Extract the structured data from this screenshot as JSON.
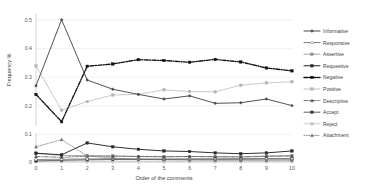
{
  "chart_data": {
    "type": "line",
    "title": "",
    "xlabel": "Order of the comments",
    "ylabel": "Frequency %",
    "x": [
      0,
      1,
      2,
      3,
      4,
      5,
      6,
      7,
      8,
      9,
      10
    ],
    "xlim": [
      0,
      10
    ],
    "ylim": [
      0,
      0.5
    ],
    "grid": true,
    "legend_position": "right",
    "xticks": [
      "0",
      "1",
      "2",
      "3",
      "4",
      "5",
      "6",
      "7",
      "8",
      "9",
      "10"
    ],
    "yticks_upper": [
      "0.2",
      "0.3",
      "0.4",
      "0.5"
    ],
    "yticks_lower": [
      "0",
      "0.1"
    ],
    "axis_break": true,
    "panels": [
      {
        "name": "upper",
        "ymin": 0.13,
        "ymax": 0.52,
        "series": [
          "Informative",
          "Negative",
          "Positive"
        ]
      },
      {
        "name": "lower",
        "ymin": 0.0,
        "ymax": 0.105,
        "series": [
          "Responsive",
          "Assertive",
          "Requestive",
          "Descriptive",
          "Accept",
          "Reject",
          "Attachment"
        ]
      }
    ],
    "series": [
      {
        "name": "Informative",
        "color": "#4a4a4a",
        "dash": "none",
        "marker": "diamond",
        "panel": "upper",
        "values": [
          0.27,
          0.5,
          0.29,
          0.258,
          0.24,
          0.224,
          0.235,
          0.209,
          0.211,
          0.224,
          0.201
        ]
      },
      {
        "name": "Responsive",
        "color": "#595959",
        "dash": "none",
        "marker": "circle-open",
        "panel": "lower",
        "values": [
          0.009,
          0.01,
          0.011,
          0.012,
          0.011,
          0.011,
          0.011,
          0.011,
          0.012,
          0.012,
          0.012
        ]
      },
      {
        "name": "Assertive",
        "color": "#8c8c8c",
        "dash": "none",
        "marker": "square",
        "panel": "lower",
        "values": [
          0.031,
          0.024,
          0.023,
          0.022,
          0.02,
          0.019,
          0.02,
          0.019,
          0.019,
          0.022,
          0.024
        ]
      },
      {
        "name": "Requestive",
        "color": "#262626",
        "dash": "none",
        "marker": "square",
        "panel": "lower",
        "values": [
          0.032,
          0.026,
          0.069,
          0.055,
          0.046,
          0.04,
          0.038,
          0.033,
          0.03,
          0.033,
          0.04
        ]
      },
      {
        "name": "Negative",
        "color": "#111111",
        "dash": "dashdot",
        "marker": "square",
        "panel": "upper",
        "values": [
          0.24,
          0.145,
          0.338,
          0.346,
          0.361,
          0.358,
          0.352,
          0.362,
          0.353,
          0.332,
          0.322
        ]
      },
      {
        "name": "Positive",
        "color": "#b3b3b3",
        "dash": "none",
        "marker": "square",
        "panel": "upper",
        "values": [
          0.339,
          0.185,
          0.215,
          0.238,
          0.24,
          0.256,
          0.25,
          0.249,
          0.272,
          0.28,
          0.284
        ]
      },
      {
        "name": "Descriptive",
        "color": "#4d4d4d",
        "dash": "dashdot",
        "marker": "triangle",
        "panel": "lower",
        "values": [
          0.02,
          0.017,
          0.021,
          0.021,
          0.02,
          0.019,
          0.02,
          0.019,
          0.018,
          0.02,
          0.021
        ]
      },
      {
        "name": "Accept",
        "color": "#333333",
        "dash": "none",
        "marker": "square",
        "panel": "lower",
        "values": [
          0.004,
          0.006,
          0.008,
          0.009,
          0.009,
          0.009,
          0.01,
          0.01,
          0.01,
          0.011,
          0.011
        ]
      },
      {
        "name": "Reject",
        "color": "#bfbfbf",
        "dash": "none",
        "marker": "square",
        "panel": "lower",
        "values": [
          0.003,
          0.003,
          0.003,
          0.003,
          0.003,
          0.003,
          0.003,
          0.003,
          0.003,
          0.003,
          0.003
        ]
      },
      {
        "name": "Attachment",
        "color": "#737373",
        "dash": "dotted",
        "marker": "triangle",
        "panel": "lower",
        "values": [
          0.055,
          0.081,
          0.022,
          0.014,
          0.01,
          0.008,
          0.007,
          0.006,
          0.006,
          0.006,
          0.006
        ]
      }
    ]
  },
  "legend": {
    "items": [
      {
        "label": "Informative"
      },
      {
        "label": "Responsive"
      },
      {
        "label": "Assertive"
      },
      {
        "label": "Requestive"
      },
      {
        "label": "Negative"
      },
      {
        "label": "Positive"
      },
      {
        "label": "Descriptive"
      },
      {
        "label": "Accept"
      },
      {
        "label": "Reject"
      },
      {
        "label": "Attachment"
      }
    ]
  }
}
